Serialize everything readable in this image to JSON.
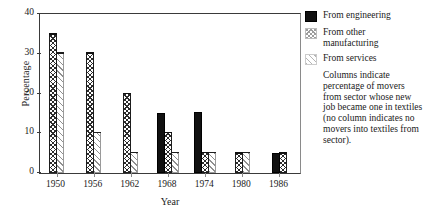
{
  "chart_data": {
    "type": "bar",
    "title": "",
    "subtitle": "",
    "xlabel": "Year",
    "ylabel": "Percentage",
    "categories": [
      "1950",
      "1956",
      "1962",
      "1968",
      "1974",
      "1980",
      "1986"
    ],
    "ylim": [
      0,
      40
    ],
    "yticks": [
      0,
      10,
      20,
      30,
      40
    ],
    "ytick_labels": [
      "0",
      "10",
      "20",
      "30",
      "40"
    ],
    "grid": false,
    "legend_position": "right",
    "series": [
      {
        "name": "From engineering",
        "pattern": "solid-black",
        "values": [
          null,
          null,
          null,
          15.2,
          15.4,
          null,
          5.1
        ]
      },
      {
        "name": "From other manufacturing",
        "pattern": "cross-hatch",
        "values": [
          35.2,
          30.4,
          20.2,
          10.4,
          5.4,
          5.2,
          5.2
        ]
      },
      {
        "name": "From services",
        "pattern": "diagonal-lines",
        "values": [
          30.4,
          10.4,
          5.4,
          5.4,
          5.4,
          5.4,
          null
        ]
      }
    ],
    "annotations": [
      "Columns indicate percentage of movers from sector whose new job became one in textiles (no column indicates no movers into textiles from sector)."
    ]
  },
  "legend": {
    "items": [
      {
        "label": "From engineering",
        "swatch": "solid-black-swatch"
      },
      {
        "label": "From other manufacturing",
        "swatch": "cross-hatch-swatch"
      },
      {
        "label": "From services",
        "swatch": "diagonal-lines-swatch"
      }
    ],
    "note": "Columns indicate percentage of movers from sector whose new job became one in textiles (no column indicates no movers into textiles from sector)."
  }
}
